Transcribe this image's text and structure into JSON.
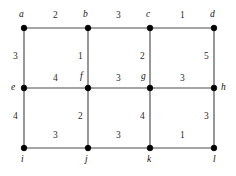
{
  "figure": {
    "kind": "weighted-grid-graph",
    "width": 236,
    "height": 176,
    "background_color": "#ffffff",
    "edge_color": "#4c4c4c",
    "vertex_color": "#000000",
    "text_color": "#1a1a1a"
  },
  "vertices": [
    {
      "id": "a",
      "label": "a",
      "x": 24,
      "y": 28,
      "label_x": 19,
      "label_y": 10
    },
    {
      "id": "b",
      "label": "b",
      "x": 88,
      "y": 28,
      "label_x": 83,
      "label_y": 10
    },
    {
      "id": "c",
      "label": "c",
      "x": 150,
      "y": 28,
      "label_x": 146,
      "label_y": 10
    },
    {
      "id": "d",
      "label": "d",
      "x": 214,
      "y": 28,
      "label_x": 210,
      "label_y": 10
    },
    {
      "id": "e",
      "label": "e",
      "x": 24,
      "y": 88,
      "label_x": 11,
      "label_y": 83
    },
    {
      "id": "f",
      "label": "f",
      "x": 88,
      "y": 88,
      "label_x": 80,
      "label_y": 72
    },
    {
      "id": "g",
      "label": "g",
      "x": 150,
      "y": 88,
      "label_x": 141,
      "label_y": 72
    },
    {
      "id": "h",
      "label": "h",
      "x": 214,
      "y": 88,
      "label_x": 221,
      "label_y": 83
    },
    {
      "id": "i",
      "label": "i",
      "x": 24,
      "y": 148,
      "label_x": 21,
      "label_y": 155
    },
    {
      "id": "j",
      "label": "j",
      "x": 88,
      "y": 148,
      "label_x": 85,
      "label_y": 155
    },
    {
      "id": "k",
      "label": "k",
      "x": 150,
      "y": 148,
      "label_x": 147,
      "label_y": 155
    },
    {
      "id": "l",
      "label": "l",
      "x": 214,
      "y": 148,
      "label_x": 213,
      "label_y": 155
    }
  ],
  "edges": [
    {
      "id": "ab",
      "from": "a",
      "to": "b",
      "weight": "2",
      "orientation": "horizontal",
      "label_x": 53,
      "label_y": 11
    },
    {
      "id": "bc",
      "from": "b",
      "to": "c",
      "weight": "3",
      "orientation": "horizontal",
      "label_x": 116,
      "label_y": 11
    },
    {
      "id": "cd",
      "from": "c",
      "to": "d",
      "weight": "1",
      "orientation": "horizontal",
      "label_x": 180,
      "label_y": 11
    },
    {
      "id": "ae",
      "from": "a",
      "to": "e",
      "weight": "3",
      "orientation": "vertical",
      "label_x": 13,
      "label_y": 52
    },
    {
      "id": "bf",
      "from": "b",
      "to": "f",
      "weight": "1",
      "orientation": "vertical",
      "label_x": 78,
      "label_y": 52
    },
    {
      "id": "cg",
      "from": "c",
      "to": "g",
      "weight": "2",
      "orientation": "vertical",
      "label_x": 140,
      "label_y": 52
    },
    {
      "id": "dh",
      "from": "d",
      "to": "h",
      "weight": "5",
      "orientation": "vertical",
      "label_x": 204,
      "label_y": 52
    },
    {
      "id": "ef",
      "from": "e",
      "to": "f",
      "weight": "4",
      "orientation": "horizontal",
      "label_x": 53,
      "label_y": 74
    },
    {
      "id": "fg",
      "from": "f",
      "to": "g",
      "weight": "3",
      "orientation": "horizontal",
      "label_x": 116,
      "label_y": 74
    },
    {
      "id": "gh",
      "from": "g",
      "to": "h",
      "weight": "3",
      "orientation": "horizontal",
      "label_x": 180,
      "label_y": 74
    },
    {
      "id": "ei",
      "from": "e",
      "to": "i",
      "weight": "4",
      "orientation": "vertical",
      "label_x": 13,
      "label_y": 112
    },
    {
      "id": "fj",
      "from": "f",
      "to": "j",
      "weight": "2",
      "orientation": "vertical",
      "label_x": 78,
      "label_y": 112
    },
    {
      "id": "gk",
      "from": "g",
      "to": "k",
      "weight": "4",
      "orientation": "vertical",
      "label_x": 140,
      "label_y": 112
    },
    {
      "id": "hl",
      "from": "h",
      "to": "l",
      "weight": "3",
      "orientation": "vertical",
      "label_x": 204,
      "label_y": 112
    },
    {
      "id": "ij",
      "from": "i",
      "to": "j",
      "weight": "3",
      "orientation": "horizontal",
      "label_x": 53,
      "label_y": 131
    },
    {
      "id": "jk",
      "from": "j",
      "to": "k",
      "weight": "3",
      "orientation": "horizontal",
      "label_x": 116,
      "label_y": 131
    },
    {
      "id": "kl",
      "from": "k",
      "to": "l",
      "weight": "1",
      "orientation": "horizontal",
      "label_x": 180,
      "label_y": 131
    }
  ]
}
